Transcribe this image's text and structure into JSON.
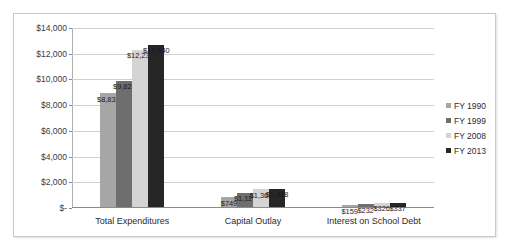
{
  "chart_data": {
    "type": "bar",
    "title": "",
    "subtitle": "",
    "xlabel": "",
    "ylabel": "",
    "grid": true,
    "legend_position": "right",
    "categories": [
      "Total Expenditures",
      "Capital Outlay",
      "Interest on School Debt"
    ],
    "ylim": [
      0,
      14000
    ],
    "yticks": [
      0,
      2000,
      4000,
      6000,
      8000,
      10000,
      12000,
      14000
    ],
    "ytick_labels": [
      "$-",
      "$2,000",
      "$4,000",
      "$6,000",
      "$8,000",
      "$10,000",
      "$12,000",
      "$14,000"
    ],
    "series": [
      {
        "name": "FY 1990",
        "color": "#a6a6a6",
        "values": [
          8832,
          749,
          159
        ],
        "labels": [
          "$8,832",
          "$749",
          "$159"
        ]
      },
      {
        "name": "FY 1999",
        "color": "#6e6e6e",
        "values": [
          9823,
          1119,
          232
        ],
        "labels": [
          "$9,823",
          "$1,119",
          "$232"
        ]
      },
      {
        "name": "FY 2008",
        "color": "#d4d4d4",
        "values": [
          12238,
          1368,
          326
        ],
        "labels": [
          "$12,238",
          "$1,368",
          "$326"
        ]
      },
      {
        "name": "FY 2013",
        "color": "#262626",
        "values": [
          12640,
          1418,
          337
        ],
        "labels": [
          "$12,640",
          "$1,418",
          "$337"
        ]
      }
    ]
  }
}
